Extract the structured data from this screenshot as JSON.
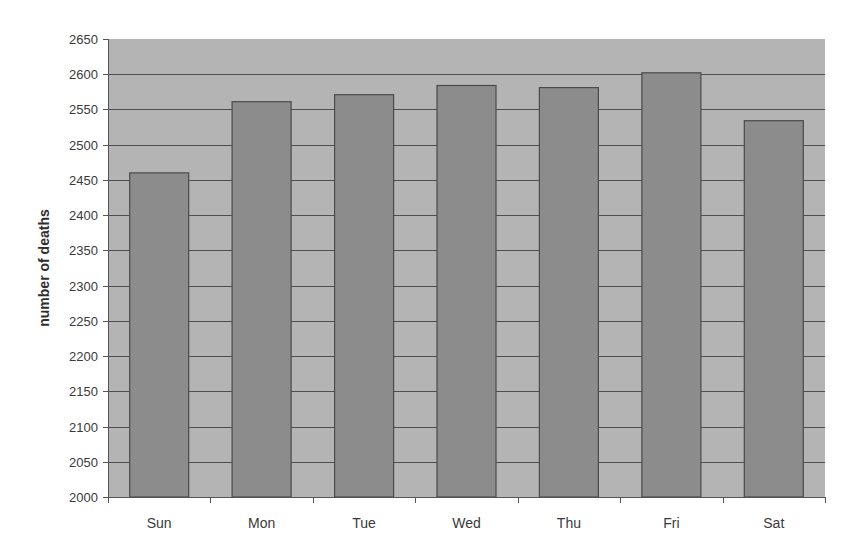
{
  "chart_data": {
    "type": "bar",
    "title": "",
    "xlabel": "",
    "ylabel": "number of deaths",
    "categories": [
      "Sun",
      "Mon",
      "Tue",
      "Wed",
      "Thu",
      "Fri",
      "Sat"
    ],
    "values": [
      2460,
      2561,
      2571,
      2584,
      2581,
      2602,
      2534
    ],
    "ylim": [
      2000,
      2650
    ],
    "yticks": [
      2000,
      2050,
      2100,
      2150,
      2200,
      2250,
      2300,
      2350,
      2400,
      2450,
      2500,
      2550,
      2600,
      2650
    ],
    "grid": true,
    "legend": null
  },
  "colors": {
    "plot_background": "#b4b4b4",
    "bar_fill": "#8c8c8c",
    "bar_stroke": "#4a4a4a",
    "gridline": "#4e4e4e",
    "axis": "#555555"
  }
}
